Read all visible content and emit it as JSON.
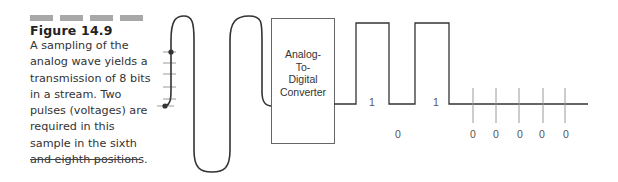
{
  "figure": {
    "number_label": "Figure 14.9",
    "caption_lines": [
      "A sampling of the",
      "analog wave yields a",
      "transmission of 8 bits",
      "in a stream. Two",
      "pulses (voltages) are",
      "required in this",
      "sample in the sixth",
      "and eighth positions."
    ]
  },
  "diagram": {
    "converter_label_lines": [
      "Analog-",
      "To-",
      "Digital",
      "Converter"
    ],
    "bits": [
      {
        "value": "1",
        "position": "high-pulse-1"
      },
      {
        "value": "0",
        "position": "low-gap"
      },
      {
        "value": "1",
        "position": "high-pulse-2"
      },
      {
        "value": "0",
        "position": "tail-1"
      },
      {
        "value": "0",
        "position": "tail-2"
      },
      {
        "value": "0",
        "position": "tail-3"
      },
      {
        "value": "0",
        "position": "tail-4"
      },
      {
        "value": "0",
        "position": "tail-5"
      }
    ],
    "colors": {
      "line": "#333333",
      "tick": "#999999",
      "header_bars": "#a8a8a8"
    }
  }
}
